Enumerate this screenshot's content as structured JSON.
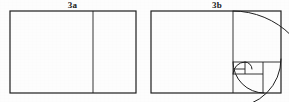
{
  "plate": {
    "name": "fibonacci-golden-rectangle-plate",
    "background_color": "#fdfdfd",
    "ink_color": "#1a1a1a",
    "width": 289,
    "height": 102
  },
  "panels": [
    {
      "id": "3a",
      "label": "3a",
      "caption": "",
      "description": "Golden rectangle divided by one vertical line into a square and a smaller rectangle",
      "frame": {
        "x": 10,
        "y": 11,
        "width": 126,
        "height": 82
      },
      "dividers": [
        {
          "orientation": "vertical",
          "x": 93,
          "y1": 11,
          "y2": 93
        }
      ],
      "squares": [
        {
          "order": 1,
          "x": 10,
          "y": 11,
          "size": 82
        }
      ],
      "spiral_arcs": []
    },
    {
      "id": "3b",
      "label": "3b",
      "caption": "",
      "description": "Golden rectangle recursively subdivided into Fibonacci squares with a logarithmic spiral inscribed",
      "frame": {
        "x": 6,
        "y": 11,
        "width": 130,
        "height": 82
      },
      "dividers": [
        {
          "orientation": "vertical",
          "x": 88,
          "y1": 11,
          "y2": 93
        },
        {
          "orientation": "horizontal",
          "y": 62,
          "x1": 88,
          "x2": 136
        },
        {
          "orientation": "vertical",
          "x": 118,
          "y1": 62,
          "y2": 93
        },
        {
          "orientation": "horizontal",
          "y": 74,
          "x1": 88,
          "x2": 118
        },
        {
          "orientation": "vertical",
          "x": 100,
          "y1": 62,
          "y2": 74
        },
        {
          "orientation": "horizontal",
          "y": 69,
          "x1": 88,
          "x2": 100
        }
      ],
      "squares": [
        {
          "order": 1,
          "x": 6,
          "y": 11,
          "size": 82
        },
        {
          "order": 2,
          "x": 88,
          "y": 11,
          "size": 48
        },
        {
          "order": 3,
          "x": 88,
          "y": 62,
          "size": 31
        },
        {
          "order": 4,
          "x": 100,
          "y": 62,
          "size": 12
        },
        {
          "order": 5,
          "x": 88,
          "y": 62,
          "size": 7
        }
      ],
      "spiral_arcs": [
        {
          "order": 1,
          "cx": 88,
          "cy": 93,
          "r": 82,
          "start_deg": 270,
          "sweep_deg": 90
        },
        {
          "order": 2,
          "cx": 88,
          "cy": 59,
          "r": 48,
          "start_deg": 0,
          "sweep_deg": 90
        },
        {
          "order": 3,
          "cx": 119,
          "cy": 62,
          "r": 31,
          "start_deg": 90,
          "sweep_deg": 90
        },
        {
          "order": 4,
          "cx": 100,
          "cy": 74,
          "r": 12,
          "start_deg": 180,
          "sweep_deg": 90
        },
        {
          "order": 5,
          "cx": 100,
          "cy": 69,
          "r": 7,
          "start_deg": 270,
          "sweep_deg": 90
        }
      ]
    }
  ],
  "style": {
    "stroke_color": "#1f1f1f",
    "frame_stroke_width": 1.2,
    "divider_stroke_width": 0.9,
    "spiral_stroke_width": 1.0
  }
}
